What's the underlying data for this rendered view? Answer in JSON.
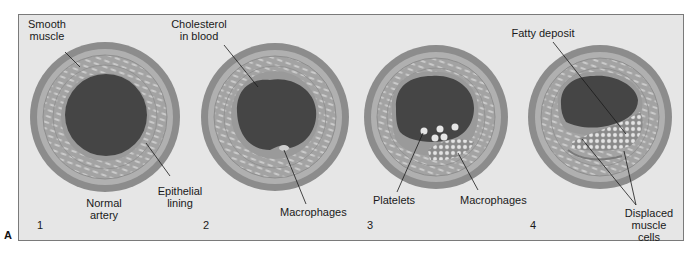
{
  "figure": {
    "letter": "A",
    "colors": {
      "background": "#e6e6e6",
      "frame": "#7a7a7a",
      "outer_wall": "#8c8c8c",
      "muscle_layer": "#a5a5a5",
      "muscle_stripe": "#c9c9c9",
      "lumen": "#454545",
      "epithelium": "#9a9a9a",
      "deposit": "#8a8a8a",
      "cell": "#e2e2e2",
      "leader_line": "#1a1a1a"
    },
    "panels": [
      {
        "number": "1",
        "caption": "Normal\nartery",
        "labels": [
          "Smooth\nmuscle",
          "Epithelial\nlining"
        ]
      },
      {
        "number": "2",
        "labels": [
          "Cholesterol\nin blood",
          "Macrophages"
        ]
      },
      {
        "number": "3",
        "labels": [
          "Platelets",
          "Macrophages"
        ]
      },
      {
        "number": "4",
        "labels": [
          "Fatty deposit",
          "Displaced\nmuscle cells"
        ]
      }
    ]
  }
}
